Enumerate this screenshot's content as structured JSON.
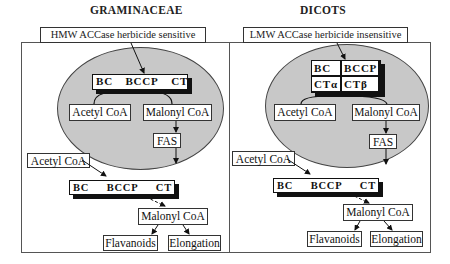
{
  "panels": {
    "left": {
      "title": "GRAMINACEAE",
      "header_label": "HMW ACCase herbicide sensitive",
      "plastid_enzyme": {
        "domains": [
          "BC",
          "BCCP",
          "CT"
        ]
      },
      "plastid_substrate": "Acetyl CoA",
      "plastid_product": "Malonyl CoA",
      "fas": "FAS",
      "cytosol_substrate": "Acetyl CoA",
      "cytosol_enzyme": {
        "domains": [
          "BC",
          "BCCP",
          "CT"
        ]
      },
      "cytosol_product": "Malonyl CoA",
      "outputs": [
        "Flavanoids",
        "Elongation"
      ]
    },
    "right": {
      "title": "DICOTS",
      "header_label": "LMW ACCase herbicide insensitive",
      "plastid_enzyme": {
        "subunits": [
          "BC",
          "BCCP",
          "CTα",
          "CTβ"
        ]
      },
      "plastid_substrate": "Acetyl CoA",
      "plastid_product": "Malonyl CoA",
      "fas": "FAS",
      "cytosol_substrate": "Acetyl CoA",
      "cytosol_enzyme": {
        "domains": [
          "BC",
          "BCCP",
          "CT"
        ]
      },
      "cytosol_product": "Malonyl CoA",
      "outputs": [
        "Flavanoids",
        "Elongation"
      ]
    }
  },
  "colors": {
    "plastid_fill": "#c8c8c8",
    "outline": "#333333",
    "enzyme_shadow": "#111111"
  }
}
